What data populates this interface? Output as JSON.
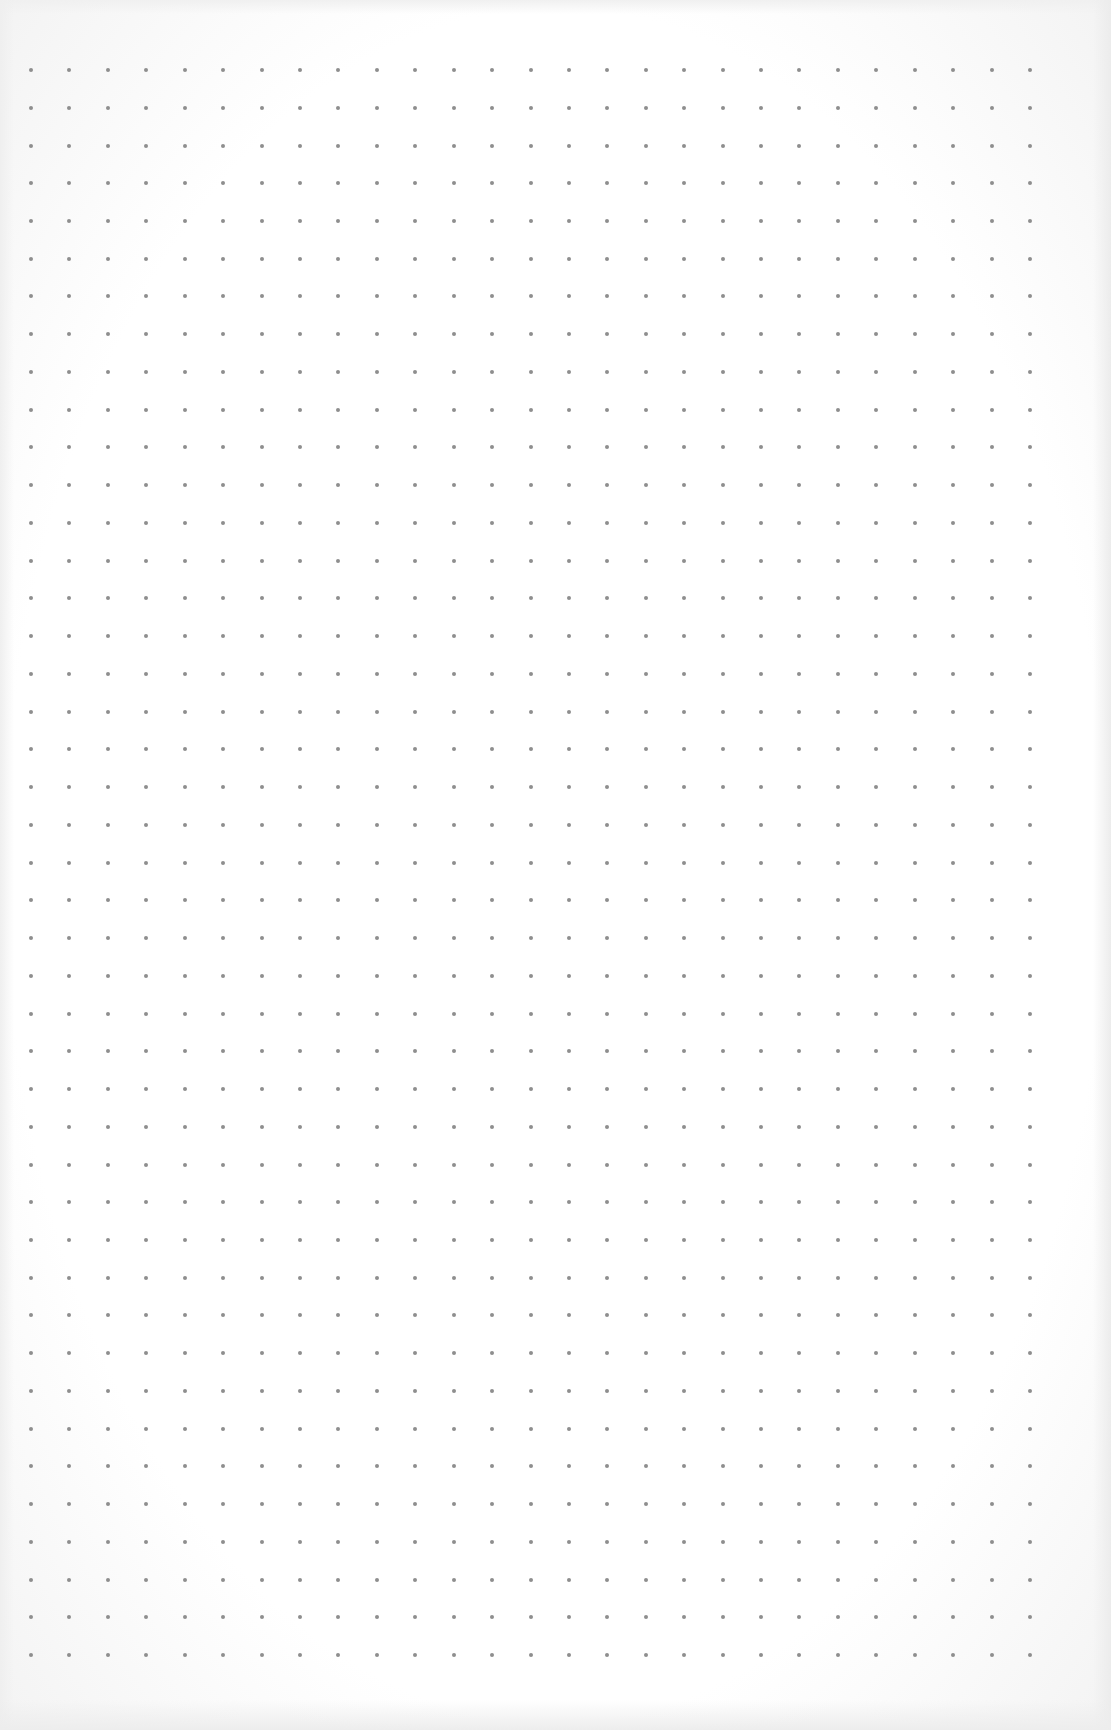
{
  "page": {
    "type": "dot-grid paper",
    "background_color": "#ffffff",
    "dot_color": "#8e8e8e"
  },
  "grid": {
    "columns": 27,
    "rows": 43,
    "origin_x": 31,
    "origin_y": 70,
    "step_x": 38.42,
    "step_y": 37.74,
    "dot_diameter": 4
  }
}
